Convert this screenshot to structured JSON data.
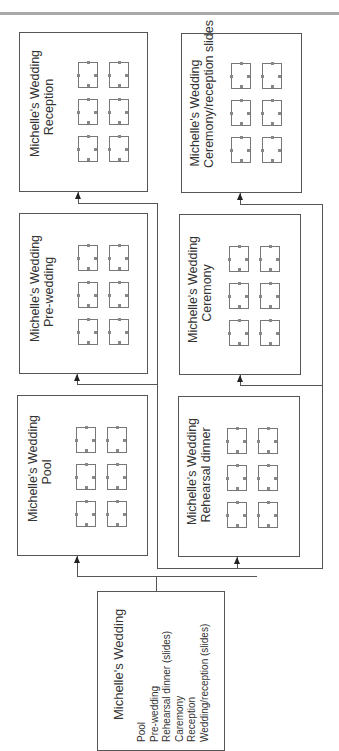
{
  "diagram": {
    "type": "storyboard-flow",
    "orientation": "rotated-90-ccw",
    "colors": {
      "line": "#555555",
      "background": "#ffffff",
      "top_rule": "#a9a9a9"
    },
    "overview": {
      "title": "Michelle's Wedding",
      "items": [
        "Pool",
        "Pre-wedding",
        "Rehearsal dinner (slides)",
        "Caremony",
        "Reception",
        "Wedding/reception (slides)"
      ]
    },
    "sections": [
      {
        "id": "reception",
        "line1": "Michelle's Wedding",
        "line2": "Reception",
        "thumbnails": 6
      },
      {
        "id": "pre-wedding",
        "line1": "Michelle's Wedding",
        "line2": "Pre-wedding",
        "thumbnails": 6
      },
      {
        "id": "pool",
        "line1": "Michelle's Wedding",
        "line2": "Pool",
        "thumbnails": 6
      },
      {
        "id": "ceremony-reception-slides",
        "line1": "Michelle's Wedding",
        "line2": "Ceremony/reception slides",
        "thumbnails": 6
      },
      {
        "id": "ceremony",
        "line1": "Michelle's Wedding",
        "line2": "Ceremony",
        "thumbnails": 6
      },
      {
        "id": "rehearsal-dinner",
        "line1": "Michelle's Wedding",
        "line2": "Rehearsal dinner",
        "thumbnails": 6
      }
    ]
  }
}
